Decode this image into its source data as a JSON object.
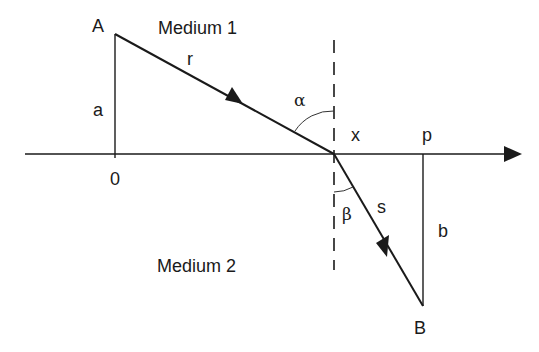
{
  "diagram": {
    "type": "refraction-geometry",
    "colors": {
      "ink": "#1a1a1a",
      "background": "#ffffff"
    },
    "regions": {
      "upper": "Medium 1",
      "lower": "Medium 2"
    },
    "points": {
      "A": "A",
      "B": "B",
      "origin": "0",
      "x": "x",
      "p": "p"
    },
    "segments": {
      "incident": "r",
      "refracted": "s",
      "height_a": "a",
      "height_b": "b"
    },
    "angles": {
      "incidence": "α",
      "refraction": "β"
    },
    "geometry": {
      "axis": {
        "x1": 25,
        "y1": 154,
        "x2": 521,
        "y2": 154
      },
      "A": {
        "x": 115,
        "y": 34
      },
      "origin": {
        "x": 115,
        "y": 154
      },
      "intersection": {
        "x": 334,
        "y": 154
      },
      "p": {
        "x": 423,
        "y": 154
      },
      "B": {
        "x": 423,
        "y": 306
      },
      "normal": {
        "x": 334,
        "y1": 40,
        "y2": 268
      }
    }
  }
}
